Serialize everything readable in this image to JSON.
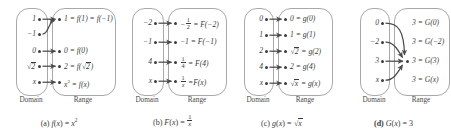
{
  "figure": {
    "type": "function-mapping-diagrams",
    "panel_count": 4,
    "axis_labels": {
      "domain": "Domain",
      "range": "Range"
    },
    "colors": {
      "oval_stroke": "#a8a8a8",
      "dot": "#3d3d3d",
      "arrow": "#4a4a4a",
      "text": "#3a3a3a",
      "background": "#ffffff"
    }
  },
  "panels": [
    {
      "id": "a",
      "caption_prefix": "(a)",
      "caption_function": "f(x) = x²",
      "domain_label": "Domain",
      "range_label": "Range",
      "domain_items": [
        "1",
        "−1",
        "0",
        "√2",
        "x"
      ],
      "range_items": [
        "1 = f(1) = f(−1)",
        "0 = f(0)",
        "2 = f(√2)",
        "x² = f(x)"
      ],
      "mappings": [
        {
          "from": "1",
          "to": "1 = f(1) = f(−1)",
          "style": "straight"
        },
        {
          "from": "−1",
          "to": "1 = f(1) = f(−1)",
          "style": "curved"
        },
        {
          "from": "0",
          "to": "0 = f(0)",
          "style": "straight"
        },
        {
          "from": "√2",
          "to": "2 = f(√2)",
          "style": "straight"
        },
        {
          "from": "x",
          "to": "x² = f(x)",
          "style": "straight"
        }
      ]
    },
    {
      "id": "b",
      "caption_prefix": "(b)",
      "caption_function": "F(x) = 1/x",
      "domain_label": "Domain",
      "range_label": "Range",
      "domain_items": [
        "−2",
        "−1",
        "4",
        "x"
      ],
      "range_items": [
        "−½ = F(−2)",
        "−1 = F(−1)",
        "¼ = F(4)",
        "1/x = F(x)"
      ],
      "mappings": [
        {
          "from": "−2",
          "to": "−½ = F(−2)",
          "style": "straight"
        },
        {
          "from": "−1",
          "to": "−1 = F(−1)",
          "style": "straight"
        },
        {
          "from": "4",
          "to": "¼ = F(4)",
          "style": "straight"
        },
        {
          "from": "x",
          "to": "1/x = F(x)",
          "style": "straight"
        }
      ]
    },
    {
      "id": "c",
      "caption_prefix": "(c)",
      "caption_function": "g(x) = √x",
      "domain_label": "Domain",
      "range_label": "Range",
      "domain_items": [
        "0",
        "1",
        "2",
        "4",
        "x"
      ],
      "range_items": [
        "0 = g(0)",
        "1 = g(1)",
        "√2 = g(2)",
        "2 = g(4)",
        "√x = g(x)"
      ],
      "mappings": [
        {
          "from": "0",
          "to": "0 = g(0)",
          "style": "straight"
        },
        {
          "from": "1",
          "to": "1 = g(1)",
          "style": "straight"
        },
        {
          "from": "2",
          "to": "√2 = g(2)",
          "style": "straight"
        },
        {
          "from": "4",
          "to": "2 = g(4)",
          "style": "straight"
        },
        {
          "from": "x",
          "to": "√x = g(x)",
          "style": "straight"
        }
      ]
    },
    {
      "id": "d",
      "caption_prefix": "(d)",
      "caption_function": "G(x) = 3",
      "domain_label": "Domain",
      "range_label": "Range",
      "domain_items": [
        "0",
        "−2",
        "3",
        "x"
      ],
      "range_items": [
        "3 = G(0)",
        "3 = G(−2)",
        "3 = G(3)",
        "3 = G(x)"
      ],
      "range_dot_count": 1,
      "mappings": [
        {
          "from": "0",
          "to": "3 = G(3)",
          "style": "curved"
        },
        {
          "from": "−2",
          "to": "3 = G(3)",
          "style": "curved"
        },
        {
          "from": "3",
          "to": "3 = G(3)",
          "style": "straight"
        },
        {
          "from": "x",
          "to": "3 = G(3)",
          "style": "curved"
        }
      ]
    }
  ]
}
